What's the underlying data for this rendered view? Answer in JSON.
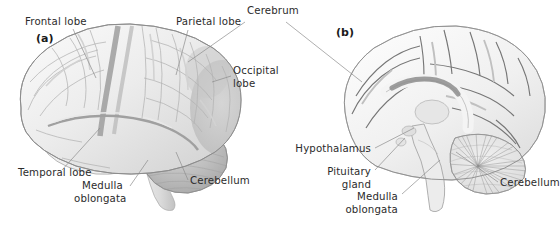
{
  "figure": {
    "background_color": "#ffffff",
    "text_color": "#2b2b2b",
    "leader_line_color": "#8d8d8d",
    "width": 560,
    "height": 228
  },
  "panels": [
    {
      "letter": "(a)",
      "name": "lateral-view",
      "x": 36,
      "y": 42
    },
    {
      "letter": "(b)",
      "name": "midsagittal-view",
      "x": 336,
      "y": 36
    }
  ],
  "shared_labels": [
    {
      "id": "cerebrum",
      "text": "Cerebrum",
      "x": 247,
      "y": 14,
      "anchor": "start"
    }
  ],
  "labels_panel_a": [
    {
      "id": "frontal-lobe",
      "text": "Frontal lobe",
      "x": 25,
      "y": 25,
      "anchor": "start"
    },
    {
      "id": "parietal-lobe",
      "text": "Parietal lobe",
      "x": 176,
      "y": 25,
      "anchor": "start"
    },
    {
      "id": "occipital-lobe",
      "text": "Occipital",
      "text_line2": "lobe",
      "x": 233,
      "y": 74,
      "anchor": "start"
    },
    {
      "id": "temporal-lobe",
      "text": "Temporal lobe",
      "x": 18,
      "y": 176,
      "anchor": "start"
    },
    {
      "id": "medulla-oblongata-a",
      "text": "Medulla",
      "text_line2": "oblongata",
      "x": 82,
      "y": 189,
      "anchor": "start"
    },
    {
      "id": "cerebellum-a",
      "text": "Cerebellum",
      "x": 190,
      "y": 184,
      "anchor": "start"
    }
  ],
  "labels_panel_b": [
    {
      "id": "hypothalamus",
      "text": "Hypothalamus",
      "x": 371,
      "y": 152,
      "anchor": "end"
    },
    {
      "id": "pituitary-gland",
      "text": "Pituitary",
      "text_line2": "gland",
      "x": 371,
      "y": 175,
      "anchor": "end"
    },
    {
      "id": "medulla-oblongata-b",
      "text": "Medulla",
      "text_line2": "oblongata",
      "x": 398,
      "y": 197,
      "anchor": "end"
    },
    {
      "id": "cerebellum-b",
      "text": "Cerebellum",
      "x": 500,
      "y": 186,
      "anchor": "start"
    }
  ],
  "anatomy": {
    "panel_a_structures": [
      "cerebral cortex with gyri and sulci",
      "frontal lobe",
      "parietal lobe",
      "occipital lobe",
      "temporal lobe",
      "cerebellum",
      "medulla oblongata",
      "spinal cord"
    ],
    "panel_b_structures": [
      "medial cerebral cortex",
      "corpus callosum",
      "lateral ventricle",
      "thalamus",
      "hypothalamus",
      "pituitary gland",
      "midbrain",
      "pons",
      "medulla oblongata",
      "cerebellum with arbor vitae"
    ]
  },
  "palette": {
    "tissue_light": "#f2f2f1",
    "tissue_mid": "#dedede",
    "tissue_shadow": "#c6c6c6",
    "tissue_dark": "#a8a8a8",
    "outline": "#9a9a9a",
    "sulcus": "#b4b4b4",
    "cerebellum": "#b9b9b9"
  }
}
